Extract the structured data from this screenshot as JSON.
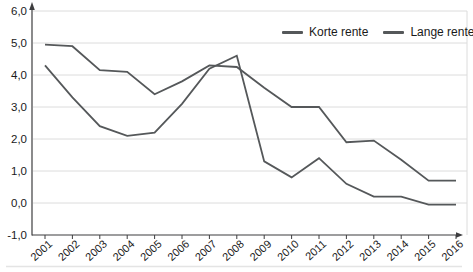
{
  "chart_data": {
    "type": "line",
    "title": "",
    "xlabel": "",
    "ylabel": "",
    "categories": [
      "2001",
      "2002",
      "2003",
      "2004",
      "2005",
      "2006",
      "2007",
      "2008",
      "2009",
      "2010",
      "2011",
      "2012",
      "2013",
      "2014",
      "2015",
      "2016"
    ],
    "series": [
      {
        "name": "Korte rente",
        "values": [
          4.3,
          3.3,
          2.4,
          2.1,
          2.2,
          3.1,
          4.2,
          4.6,
          1.3,
          0.8,
          1.4,
          0.6,
          0.2,
          0.2,
          -0.05,
          -0.05
        ]
      },
      {
        "name": "Lange rente",
        "values": [
          4.95,
          4.9,
          4.15,
          4.1,
          3.4,
          3.8,
          4.3,
          4.25,
          3.6,
          3.0,
          3.0,
          1.9,
          1.95,
          1.35,
          0.7,
          0.7
        ]
      }
    ],
    "ylim": [
      -1.0,
      6.0
    ],
    "y_step": 1.0,
    "y_tick_labels": [
      "6,0",
      "5,0",
      "4,0",
      "3,0",
      "2,0",
      "1,0",
      "0,0",
      "-1,0"
    ],
    "decimal_separator": ",",
    "grid": true,
    "legend_position": "top-right-inside"
  },
  "colors": {
    "series_korte": "#55585a",
    "series_lange": "#55585a",
    "grid": "#dcdcdc",
    "axis": "#3d3d3f",
    "text": "#1a1a1a",
    "background": "#ffffff"
  }
}
